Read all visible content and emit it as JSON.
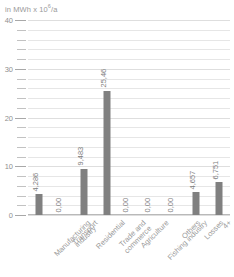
{
  "chart_data": {
    "type": "bar",
    "title": "",
    "unit_label": "in MWh x 10",
    "unit_exponent": "6",
    "unit_suffix": "/a",
    "ylabel": "",
    "xlabel": "",
    "ylim": [
      0,
      40
    ],
    "ytick_labels": [
      "0",
      "10",
      "20",
      "30",
      "40"
    ],
    "ytick_values": [
      0,
      10,
      20,
      30,
      40
    ],
    "minor_tick_step": 2,
    "grid": true,
    "legend": "none",
    "bar_color": "#808080",
    "grid_color": "#e6e6e6",
    "text_color": "#9a9a9a",
    "categories": [
      "Manufacturing industry",
      "Transport",
      "Residential",
      "Trade and commerce",
      "Agriculture",
      "Fishing industry",
      "Others",
      "Losses",
      "4+"
    ],
    "category_lines": [
      [
        "Manufacturing",
        "industry"
      ],
      [
        "Transport",
        ""
      ],
      [
        "Residential",
        ""
      ],
      [
        "Trade and",
        "commerce"
      ],
      [
        "Agriculture",
        ""
      ],
      [
        "Fishing industry",
        ""
      ],
      [
        "Others",
        ""
      ],
      [
        "Losses",
        ""
      ],
      [
        "4+",
        ""
      ]
    ],
    "values": [
      4.286,
      0.0,
      9.483,
      25.46,
      0.0,
      0.0,
      0.0,
      4.657,
      6.751
    ],
    "value_labels": [
      "4,286",
      "0,00",
      "9,483",
      "25,46",
      "0,00",
      "0,00",
      "0,00",
      "4,657",
      "6,751"
    ]
  }
}
